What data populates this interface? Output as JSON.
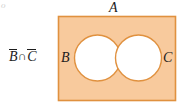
{
  "figure": {
    "type": "venn-diagram",
    "caption_expression": {
      "full": "B̄ ∩ C̄",
      "first_complement": "B",
      "operator": "∩",
      "second_complement": "C"
    },
    "universal_set_label": "A",
    "set_labels": {
      "left": "B",
      "right": "C"
    },
    "shaded_description": "complement of B intersected with complement of C",
    "colors": {
      "shaded_fill": "#f8ca9d",
      "outline": "#e0913f",
      "circle_fill": "#ffffff",
      "text": "#1c1c1c",
      "background": "#ffffff"
    },
    "geometry": {
      "rect": {
        "x": 58,
        "y": 16,
        "width": 118,
        "height": 85
      },
      "circle_left": {
        "cx": 97.5,
        "cy": 58,
        "r": 23
      },
      "circle_right": {
        "cx": 138.5,
        "cy": 58,
        "r": 23
      }
    },
    "corner_mark": "o"
  }
}
